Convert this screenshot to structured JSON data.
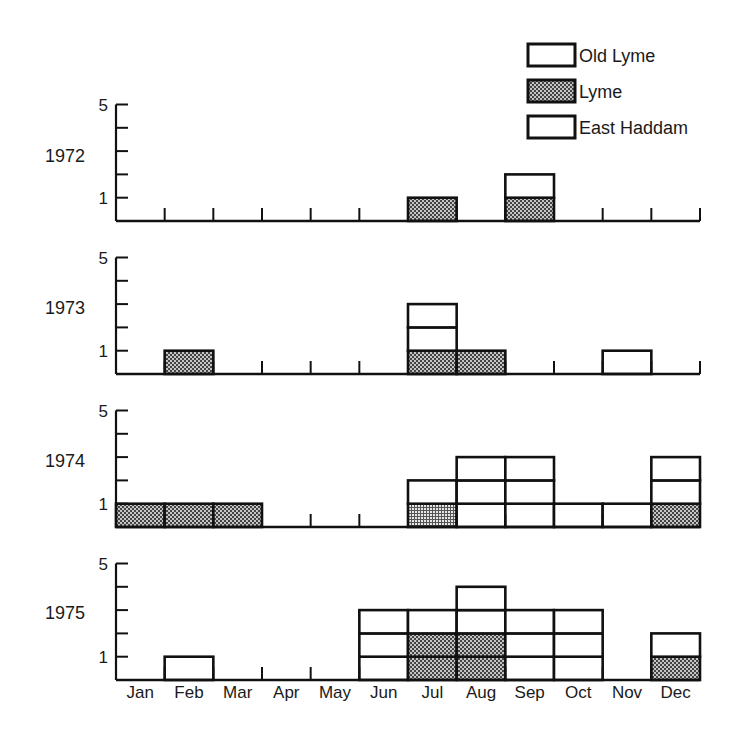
{
  "chart_data": {
    "type": "bar",
    "stacked": true,
    "title": "",
    "xlabel": "",
    "ylabel": "",
    "categories": [
      "Jan",
      "Feb",
      "Mar",
      "Apr",
      "May",
      "Jun",
      "Jul",
      "Aug",
      "Sep",
      "Oct",
      "Nov",
      "Dec"
    ],
    "yticks": [
      1,
      2,
      3,
      4,
      5
    ],
    "ytick_labels": [
      "1",
      "5"
    ],
    "ylim": [
      0,
      5
    ],
    "grid": false,
    "legend": {
      "position": "top-right",
      "entries": [
        {
          "name": "Old Lyme",
          "fill": "white"
        },
        {
          "name": "Lyme",
          "fill": "stipple"
        },
        {
          "name": "East Haddam",
          "fill": "white"
        }
      ]
    },
    "panels": [
      {
        "year": "1972",
        "lyme": [
          0,
          0,
          0,
          0,
          0,
          0,
          1,
          0,
          1,
          0,
          0,
          0
        ],
        "other": [
          0,
          0,
          0,
          0,
          0,
          0,
          0,
          0,
          1,
          0,
          0,
          0
        ]
      },
      {
        "year": "1973",
        "lyme": [
          0,
          1,
          0,
          0,
          0,
          0,
          1,
          1,
          0,
          0,
          0,
          0
        ],
        "other": [
          0,
          0,
          0,
          0,
          0,
          0,
          2,
          0,
          0,
          0,
          1,
          0
        ]
      },
      {
        "year": "1974",
        "lyme": [
          1,
          1,
          1,
          0,
          0,
          0,
          1,
          0,
          0,
          0,
          0,
          1
        ],
        "other": [
          0,
          0,
          0,
          0,
          0,
          0,
          1,
          3,
          3,
          1,
          1,
          2
        ]
      },
      {
        "year": "1975",
        "lyme": [
          0,
          0,
          0,
          0,
          0,
          0,
          2,
          2,
          0,
          0,
          0,
          1
        ],
        "other": [
          0,
          1,
          0,
          0,
          0,
          3,
          1,
          2,
          3,
          3,
          0,
          1
        ]
      }
    ]
  },
  "legend_labels": [
    "Old Lyme",
    "Lyme",
    "East Haddam"
  ],
  "month_labels": [
    "Jan",
    "Feb",
    "Mar",
    "Apr",
    "May",
    "Jun",
    "Jul",
    "Aug",
    "Sep",
    "Oct",
    "Nov",
    "Dec"
  ],
  "colors": {
    "ink": "#111111",
    "stipple_bg": "#b8b8b8",
    "stipple_dot": "#3a3a3a",
    "white": "#ffffff"
  }
}
